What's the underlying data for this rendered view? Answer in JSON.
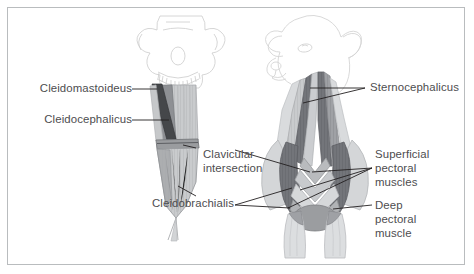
{
  "figure": {
    "kind": "veterinary-anatomy-diagram",
    "views": [
      {
        "id": "left-view",
        "description": "lateral view of head skull with neck and shoulder muscles"
      },
      {
        "id": "right-view",
        "description": "cranial frontal view of head, neck and thorax with pectoral muscles"
      }
    ],
    "border_color": "#b9bcbe",
    "background_color": "#ffffff",
    "text_color": "#4d4d4f",
    "leader_color": "#231f20"
  },
  "palette": {
    "outline_light": "#dcdcdc",
    "muscle_dark": "#6f7175",
    "muscle_mid": "#8f9195",
    "muscle_light": "#b6b8bb",
    "muscle_pale": "#cfd1d3",
    "muscle_paler": "#e2e3e5",
    "skull_line": "#c9c9c9",
    "very_dark": "#3c3e41"
  },
  "labels": [
    {
      "id": "cleidomastoideus",
      "text": "Cleidomastoideus",
      "align": "right",
      "lines": 1
    },
    {
      "id": "cleidocephalicus",
      "text": "Cleidocephalicus",
      "align": "right",
      "lines": 1
    },
    {
      "id": "clavicular-intersection-l1",
      "text": "Clavicular",
      "align": "left",
      "lines": 1
    },
    {
      "id": "clavicular-intersection-l2",
      "text": "intersection",
      "align": "left",
      "lines": 1
    },
    {
      "id": "cleidobrachialis",
      "text": "Cleidobrachialis",
      "align": "right",
      "lines": 1
    },
    {
      "id": "sternocephalicus",
      "text": "Sternocephalicus",
      "align": "left",
      "lines": 1
    },
    {
      "id": "superficial-pectoral-l1",
      "text": "Superficial",
      "align": "left",
      "lines": 1
    },
    {
      "id": "superficial-pectoral-l2",
      "text": "pectoral",
      "align": "left",
      "lines": 1
    },
    {
      "id": "superficial-pectoral-l3",
      "text": "muscles",
      "align": "left",
      "lines": 1
    },
    {
      "id": "deep-pectoral-l1",
      "text": "Deep",
      "align": "left",
      "lines": 1
    },
    {
      "id": "deep-pectoral-l2",
      "text": "pectoral",
      "align": "left",
      "lines": 1
    },
    {
      "id": "deep-pectoral-l3",
      "text": "muscle",
      "align": "left",
      "lines": 1
    }
  ],
  "label_text": {
    "cleidomastoideus": "Cleidomastoideus",
    "cleidocephalicus": "Cleidocephalicus",
    "clavicular_line1": "Clavicular",
    "clavicular_line2": "intersection",
    "cleidobrachialis": "Cleidobrachialis",
    "sternocephalicus": "Sternocephalicus",
    "superficial_line1": "Superficial",
    "superficial_line2": "pectoral",
    "superficial_line3": "muscles",
    "deep_line1": "Deep",
    "deep_line2": "pectoral",
    "deep_line3": "muscle"
  }
}
